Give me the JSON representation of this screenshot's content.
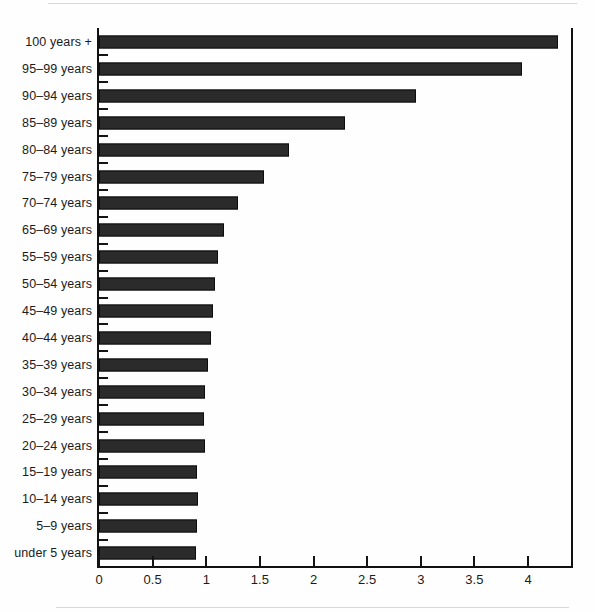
{
  "chart_data": {
    "type": "bar",
    "orientation": "horizontal",
    "title": "",
    "subtitle": "",
    "xlabel": "",
    "ylabel": "",
    "xlim": [
      0,
      4.44
    ],
    "grid": false,
    "legend": null,
    "bar_color": "#2b2b2b",
    "bar_edge_color": "#0d0d0d",
    "axis_color": "#111111",
    "background_color": "#ffffff",
    "x_ticks": [
      0,
      0.5,
      1,
      1.5,
      2,
      2.5,
      3,
      3.5,
      4
    ],
    "x_tick_labels": [
      "0",
      "0.5",
      "1",
      "1.5",
      "2",
      "2.5",
      "3",
      "3.5",
      "4"
    ],
    "categories": [
      "100 years +",
      "95–99 years",
      "90–94 years",
      "85–89 years",
      "80–84 years",
      "75–79 years",
      "70–74 years",
      "65–69 years",
      "55–59 years",
      "50–54 years",
      "45–49 years",
      "40–44 years",
      "35–39 years",
      "30–34 years",
      "25–29 years",
      "20–24 years",
      "15–19 years",
      "10–14 years",
      "5–9 years",
      "under 5 years"
    ],
    "values": [
      4.28,
      3.94,
      2.96,
      2.29,
      1.77,
      1.54,
      1.3,
      1.17,
      1.11,
      1.08,
      1.06,
      1.04,
      1.02,
      0.99,
      0.98,
      0.99,
      0.91,
      0.92,
      0.91,
      0.9
    ]
  }
}
